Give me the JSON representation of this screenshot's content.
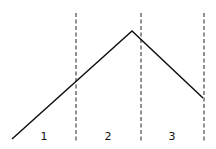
{
  "diagram": {
    "line_color": "#111111",
    "divider_color": "#222222",
    "regions": [
      {
        "id": 1,
        "label": "1"
      },
      {
        "id": 2,
        "label": "2"
      },
      {
        "id": 3,
        "label": "3"
      }
    ],
    "curve_shape": [
      "rise",
      "peak",
      "fall"
    ]
  }
}
